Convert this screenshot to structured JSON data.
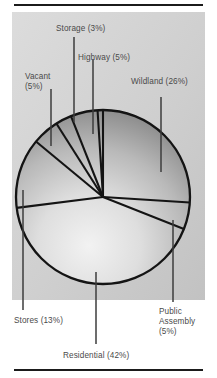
{
  "figure": {
    "background_color": "#ffffff",
    "panel_color": "#d2d2d2",
    "rule_color": "#1b1b1b",
    "label_color": "#4a4a4a",
    "outline_color": "#141414"
  },
  "chart_data": {
    "type": "pie",
    "title": "",
    "subtitle": "",
    "xlabel": "",
    "ylabel": "",
    "legend_position": "none",
    "grid": false,
    "labels_show_percent": true,
    "total_percent": 99,
    "categories": [
      "Wildland",
      "Public Assembly",
      "Residential",
      "Stores",
      "Vacant",
      "Storage",
      "Highway"
    ],
    "values": [
      26,
      5,
      42,
      13,
      5,
      3,
      5
    ],
    "slices": [
      {
        "name": "Wildland",
        "percent": 26,
        "label": "Wildland (26%)",
        "label_lines": [
          "Wildland (26%)"
        ],
        "start_angle_deg": 0,
        "end_angle_deg": 93.6
      },
      {
        "name": "Public Assembly",
        "percent": 5,
        "label": "Public Assembly (5%)",
        "label_lines": [
          "Public",
          "Assembly",
          "(5%)"
        ],
        "start_angle_deg": 93.6,
        "end_angle_deg": 111.6
      },
      {
        "name": "Residential",
        "percent": 42,
        "label": "Residential (42%)",
        "label_lines": [
          "Residential (42%)"
        ],
        "start_angle_deg": 111.6,
        "end_angle_deg": 262.8
      },
      {
        "name": "Stores",
        "percent": 13,
        "label": "Stores (13%)",
        "label_lines": [
          "Stores (13%)"
        ],
        "start_angle_deg": 262.8,
        "end_angle_deg": 309.6
      },
      {
        "name": "Vacant",
        "percent": 5,
        "label": "Vacant (5%)",
        "label_lines": [
          "Vacant",
          "(5%)"
        ],
        "start_angle_deg": 309.6,
        "end_angle_deg": 327.6
      },
      {
        "name": "Storage",
        "percent": 3,
        "label": "Storage (3%)",
        "label_lines": [
          "Storage (3%)"
        ],
        "start_angle_deg": 327.6,
        "end_angle_deg": 338.4
      },
      {
        "name": "Highway",
        "percent": 5,
        "label": "Highway (5%)",
        "label_lines": [
          "Highway (5%)"
        ],
        "start_angle_deg": 338.4,
        "end_angle_deg": 356.4
      }
    ]
  },
  "labels": {
    "storage": "Storage (3%)",
    "highway": "Highway (5%)",
    "vacant_line1": "Vacant",
    "vacant_line2": "(5%)",
    "wildland": "Wildland (26%)",
    "stores": "Stores (13%)",
    "residential": "Residential (42%)",
    "public_line1": "Public",
    "public_line2": "Assembly",
    "public_line3": "(5%)"
  }
}
